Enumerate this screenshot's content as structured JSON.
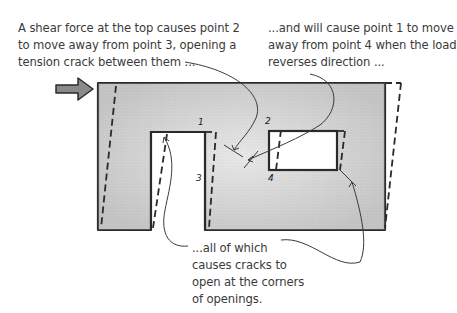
{
  "diagram": {
    "captions": {
      "left": {
        "lines": [
          "A shear force at the top causes point 2",
          "to move away from point 3, opening a",
          "tension crack between them ..."
        ]
      },
      "right": {
        "lines": [
          "...and will cause point 1 to move",
          "away from point 4 when the load",
          "reverses direction ..."
        ]
      },
      "bottom": {
        "lines": [
          "...all of which",
          "causes cracks to",
          "open at the corners",
          "of openings."
        ]
      }
    },
    "point_labels": {
      "p1": "1",
      "p2": "2",
      "p3": "3",
      "p4": "4"
    },
    "elements": {
      "force_arrow": "shear force arrow (pointing right)",
      "wall": "wall with door opening and window opening",
      "deformed_outline": "dashed lines showing racked (deformed) shape"
    },
    "colors": {
      "wall_fill": "#d9d9d9",
      "outline": "#2a2a2a",
      "arrow_fill": "#8a8a8a",
      "text": "#3a3a3a"
    }
  }
}
